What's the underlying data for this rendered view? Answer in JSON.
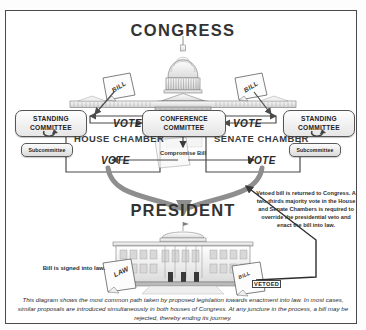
{
  "diagram": {
    "title_top": "CONGRESS",
    "title_bottom": "PRESIDENT",
    "chambers": {
      "house": "HOUSE CHAMBER",
      "senate": "SENATE CHAMBER"
    },
    "committees": {
      "standing_left": "STANDING COMMITTEE",
      "standing_right": "STANDING COMMITTEE",
      "subcommittee_left": "Subcommittee",
      "subcommittee_right": "Subcommittee",
      "conference": "CONFERENCE COMMITTEE"
    },
    "labels": {
      "vote_house_top": "VOTE",
      "vote_senate_top": "VOTE",
      "vote_house_bottom": "VOTE",
      "vote_senate_bottom": "VOTE",
      "compromise_bill": "Compromise Bill",
      "bill_left": "BILL",
      "bill_right": "BILL",
      "law_document": "LAW",
      "bill_vetoed_document": "BILL",
      "vetoed_stamp": "VETOED"
    },
    "notes": {
      "veto_override": "Vetoed bill is returned to Congress. A two-thirds majority vote in the House and Senate Chambers is required to override the presidential veto and enact the bill into law.",
      "signed_into_law": "Bill is signed into law."
    },
    "caption": "This diagram shows the most common path taken by proposed legislation towards enactment into law. In most cases, similar proposals are introduced simultaneously in both houses of Congress. At any juncture in the process, a bill may be rejected, thereby ending its journey.",
    "icons": {
      "capitol": "capitol-building-icon",
      "white_house": "white-house-icon",
      "recycle_loop": "loop-arrow-icon"
    },
    "colors": {
      "ink": "#333333",
      "flow_arrow": "#4b4b4b",
      "thick_arrow": "#8e8e8e",
      "frame": "#4a4a4a"
    }
  }
}
